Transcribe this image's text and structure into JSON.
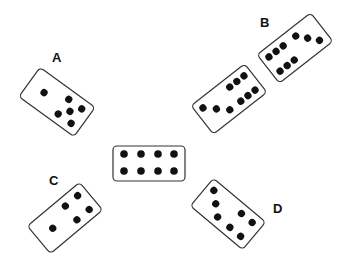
{
  "labels": {
    "a": "A",
    "b": "B",
    "c": "C",
    "d": "D"
  },
  "dominoes": [
    {
      "id": "center",
      "pips": [
        4,
        4
      ],
      "orientation": "horizontal"
    },
    {
      "id": "A",
      "pips": [
        1,
        5
      ]
    },
    {
      "id": "B-lower",
      "pips": [
        3,
        6
      ]
    },
    {
      "id": "B-upper",
      "pips": [
        6,
        3
      ]
    },
    {
      "id": "C",
      "pips": [
        1,
        4
      ]
    },
    {
      "id": "D",
      "pips": [
        3,
        4
      ]
    }
  ],
  "colors": {
    "stroke": "#333333",
    "pip": "#111111",
    "background": "#ffffff"
  }
}
